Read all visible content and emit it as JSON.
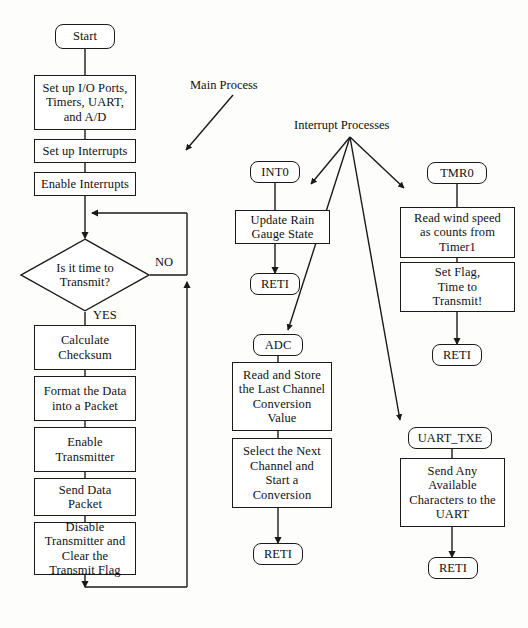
{
  "diagram": {
    "background_color": "#fdfdfc",
    "line_color": "#1a1a1a",
    "text_color": "#111111"
  },
  "annotations": {
    "main_process": "Main Process",
    "interrupt_processes": "Interrupt Processes"
  },
  "edge_labels": {
    "no": "NO",
    "yes": "YES"
  },
  "main_process": {
    "start": "Start",
    "setup_peripherals": "Set up I/O Ports,\nTimers, UART,\nand A/D",
    "setup_interrupts": "Set up Interrupts",
    "enable_interrupts": "Enable Interrupts",
    "decision": "Is it time to\nTransmit?",
    "calculate_checksum": "Calculate\nChecksum",
    "format_data": "Format the Data\ninto a Packet",
    "enable_transmitter": "Enable\nTransmitter",
    "send_data": "Send Data\nPacket",
    "disable_transmitter": "Disable\nTransmitter and\nClear the\nTransmit Flag"
  },
  "int0_process": {
    "entry": "INT0",
    "update_rain_gauge": "Update Rain\nGauge State",
    "reti": "RETI"
  },
  "adc_process": {
    "entry": "ADC",
    "read_store": "Read and Store\nthe Last Channel\nConversion\nValue",
    "select_next": "Select the Next\nChannel and\nStart a\nConversion",
    "reti": "RETI"
  },
  "tmr0_process": {
    "entry": "TMR0",
    "read_wind_speed": "Read wind speed\nas counts from\nTimer1",
    "set_flag": "Set Flag,\nTime to\nTransmit!",
    "reti": "RETI"
  },
  "uart_txe_process": {
    "entry": "UART_TXE",
    "send_characters": "Send Any\nAvailable\nCharacters to the\nUART",
    "reti": "RETI"
  }
}
